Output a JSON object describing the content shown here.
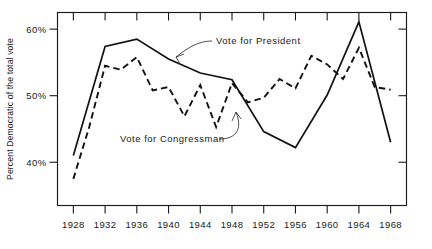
{
  "chart_data": {
    "type": "line",
    "title": "",
    "xlabel": "",
    "ylabel": "Percent Democratic of the total vote",
    "xlim": [
      1926,
      1970
    ],
    "ylim": [
      33.5,
      62.5
    ],
    "grid": false,
    "legend_position": "inline-annotations",
    "x": [
      1928,
      1930,
      1932,
      1934,
      1936,
      1938,
      1940,
      1942,
      1944,
      1946,
      1948,
      1950,
      1952,
      1954,
      1956,
      1958,
      1960,
      1962,
      1964,
      1966,
      1968
    ],
    "y_tick_values": [
      40,
      50,
      60
    ],
    "y_tick_labels": [
      "40%",
      "50%",
      "60%"
    ],
    "x_tick_values": [
      1928,
      1932,
      1936,
      1940,
      1944,
      1948,
      1952,
      1956,
      1960,
      1964,
      1968
    ],
    "x_tick_labels": [
      "1928",
      "1932",
      "1936",
      "1940",
      "1944",
      "1948",
      "1952",
      "1956",
      "1960",
      "1964",
      "1968"
    ],
    "series": [
      {
        "name": "Vote for President",
        "style": "solid",
        "x": [
          1928,
          1932,
          1936,
          1940,
          1944,
          1948,
          1952,
          1956,
          1960,
          1964,
          1968
        ],
        "values": [
          41.0,
          57.4,
          58.5,
          55.5,
          53.4,
          52.4,
          44.6,
          42.2,
          50.1,
          61.1,
          43.0
        ]
      },
      {
        "name": "Vote for Congressman",
        "style": "dashed",
        "x": [
          1928,
          1930,
          1932,
          1934,
          1936,
          1938,
          1940,
          1942,
          1944,
          1946,
          1948,
          1950,
          1952,
          1954,
          1956,
          1958,
          1960,
          1962,
          1964,
          1966,
          1968
        ],
        "values": [
          37.5,
          45.3,
          54.5,
          53.9,
          55.8,
          50.8,
          51.3,
          46.9,
          51.6,
          45.3,
          51.9,
          49.0,
          49.7,
          52.5,
          51.1,
          56.0,
          54.7,
          52.5,
          57.2,
          51.3,
          50.9
        ]
      }
    ],
    "annotations": [
      {
        "text": "Vote for President",
        "target_series": "Vote for President",
        "target_x": 1941,
        "target_y": 54.7
      },
      {
        "text": "Vote for Congressman",
        "target_series": "Vote for Congressman",
        "target_x": 1949,
        "target_y": 50.6
      }
    ]
  },
  "axis": {
    "y_title": "Percent Democratic of the total vote"
  }
}
